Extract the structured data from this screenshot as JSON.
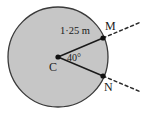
{
  "figure": {
    "colors": {
      "circle_fill": "#c6c6c6",
      "circle_stroke": "#3a3a3a",
      "line_stroke": "#1a1a1a",
      "dash_stroke": "#2a2a2a",
      "text": "#1a1a1a",
      "background": "#ffffff"
    },
    "circle": {
      "center_x": 58,
      "center_y": 57,
      "radius": 50
    },
    "center_label": "C",
    "points": [
      {
        "name": "M",
        "label": "M",
        "x": 103,
        "y": 38
      },
      {
        "name": "N",
        "label": "N",
        "x": 103,
        "y": 76
      }
    ],
    "radius_label": "1·25 m",
    "angle_label": "40°"
  }
}
